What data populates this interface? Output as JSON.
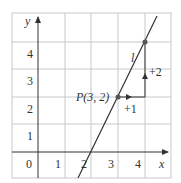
{
  "figure": {
    "axes": {
      "x_label": "x",
      "y_label": "y",
      "x_ticks": [
        "0",
        "1",
        "2",
        "3",
        "4"
      ],
      "y_ticks": [
        "1",
        "2",
        "3",
        "4"
      ]
    },
    "line": {
      "label": "l",
      "slope": 2,
      "points": [
        [
          2,
          0
        ],
        [
          3,
          2
        ],
        [
          4,
          4
        ]
      ]
    },
    "point_p": {
      "label": "P(3, 2)",
      "x": 3,
      "y": 2
    },
    "point_q": {
      "x": 4,
      "y": 4
    },
    "run_label": "+1",
    "rise_label": "+2",
    "colors": {
      "grid": "#c8c8c8",
      "axis": "#333333",
      "line": "#333333",
      "point": "#555555"
    }
  }
}
